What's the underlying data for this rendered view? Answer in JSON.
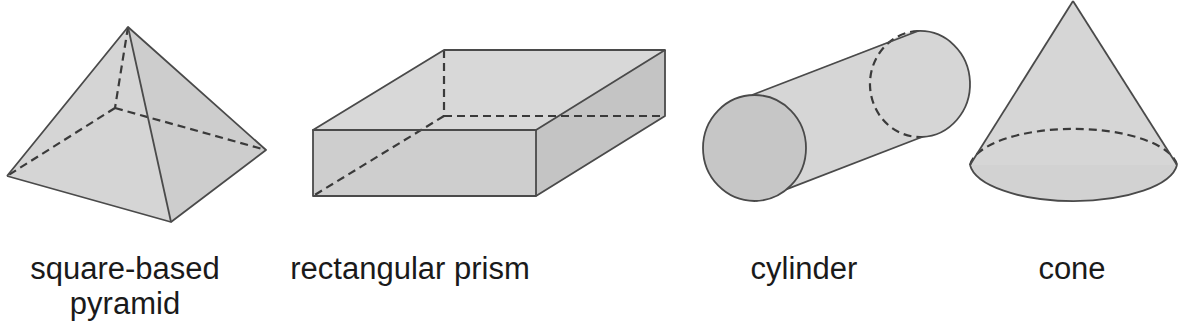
{
  "colors": {
    "fill_light": "#d8d8d8",
    "fill_mid": "#cfcfcf",
    "fill_dark": "#c4c4c4",
    "stroke": "#4a4a4a",
    "hidden_edge": "#3a3a3a",
    "text": "#1a1a1a"
  },
  "shapes": [
    {
      "id": "pyramid",
      "label_line1": "square-based",
      "label_line2": "pyramid"
    },
    {
      "id": "rectangular-prism",
      "label_line1": "rectangular prism"
    },
    {
      "id": "cylinder",
      "label_line1": "cylinder"
    },
    {
      "id": "cone",
      "label_line1": "cone"
    }
  ]
}
